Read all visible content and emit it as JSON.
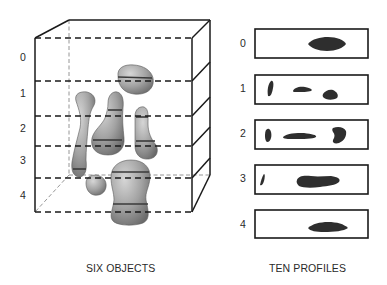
{
  "figure": {
    "left_panel": {
      "caption": "SIX OBJECTS",
      "level_labels": [
        "0",
        "1",
        "2",
        "3",
        "4"
      ],
      "object_count": 6,
      "slice_plane_count": 6
    },
    "right_panel": {
      "caption": "TEN PROFILES",
      "profiles": [
        {
          "label": "0",
          "blob_count": 1
        },
        {
          "label": "1",
          "blob_count": 3
        },
        {
          "label": "2",
          "blob_count": 3
        },
        {
          "label": "3",
          "blob_count": 2
        },
        {
          "label": "4",
          "blob_count": 1
        }
      ]
    },
    "colors": {
      "line": "#1a1a1a",
      "object_fill": "#8e8e8e",
      "object_highlight": "#d6d6d6",
      "profile_fill": "#2e2e2e",
      "back_edge": "#8a8a8a"
    }
  }
}
